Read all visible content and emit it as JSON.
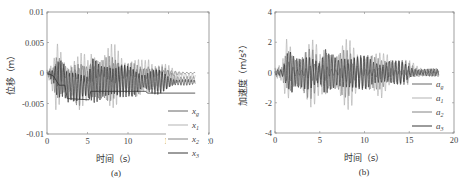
{
  "chart_data": [
    {
      "id": "a",
      "type": "line",
      "caption": "(a)",
      "title": "",
      "xlabel": "时间（s）",
      "ylabel": "位移（m）",
      "xlim": [
        0,
        20
      ],
      "ylim": [
        -0.01,
        0.01
      ],
      "xticks": [
        0,
        5,
        10,
        15,
        20
      ],
      "xtick_labels": [
        "0",
        "5",
        "10",
        "15",
        "20"
      ],
      "yticks": [
        0.01,
        0.005,
        0,
        -0.005,
        -0.01
      ],
      "ytick_labels": [
        "0.01",
        "0.005",
        "0",
        "-0.005",
        "-0.01"
      ],
      "grid": false,
      "legend_position": "lower right",
      "series": [
        {
          "name": "x_g",
          "label_base": "x",
          "label_sub": "g",
          "color": "#555555",
          "description": "ground displacement, small oscillation near 0 with drift"
        },
        {
          "name": "x_1",
          "label_base": "x",
          "label_sub": "1",
          "color": "#aaaaaa",
          "description": "floor 1 displacement"
        },
        {
          "name": "x_2",
          "label_base": "x",
          "label_sub": "2",
          "color": "#777777",
          "description": "floor 2 displacement"
        },
        {
          "name": "x_3",
          "label_base": "x",
          "label_sub": "3",
          "color": "#222222",
          "description": "floor 3 displacement"
        }
      ],
      "envelope": {
        "t": [
          0,
          0.8,
          1.2,
          1.6,
          2.0,
          2.5,
          3.0,
          4.0,
          4.5,
          5.0,
          5.6,
          6.0,
          6.5,
          7.0,
          8.0,
          8.5,
          9.0,
          9.5,
          10.0,
          11.0,
          12.0,
          12.5,
          13.0,
          14.0,
          15.0,
          16.0,
          17.0,
          18.3
        ],
        "max": [
          0.0005,
          0.002,
          0.0075,
          0.008,
          0.005,
          0.003,
          0.003,
          0.004,
          0.005,
          0.004,
          0.008,
          0.006,
          0.004,
          0.004,
          0.006,
          0.0068,
          0.0065,
          0.005,
          0.004,
          0.003,
          0.003,
          0.0045,
          0.004,
          0.003,
          0.002,
          0.001,
          0.0008,
          0.0005
        ],
        "min": [
          0.0,
          -0.004,
          -0.0095,
          -0.008,
          -0.006,
          -0.005,
          -0.004,
          -0.006,
          -0.0055,
          -0.0055,
          -0.0078,
          -0.006,
          -0.005,
          -0.004,
          -0.006,
          -0.0068,
          -0.0065,
          -0.005,
          -0.004,
          -0.004,
          -0.003,
          -0.0045,
          -0.004,
          -0.003,
          -0.002,
          -0.0015,
          -0.001,
          -0.0005
        ]
      },
      "drift_line": {
        "t": [
          0,
          0.8,
          1.5,
          2.2,
          2.5,
          5.2,
          5.4,
          6.5,
          12.2,
          12.4,
          18.3
        ],
        "y": [
          0,
          -0.0005,
          -0.002,
          -0.002,
          -0.0042,
          -0.0044,
          -0.003,
          -0.003,
          -0.003,
          -0.0033,
          -0.0033
        ]
      }
    },
    {
      "id": "b",
      "type": "line",
      "caption": "(b)",
      "title": "",
      "xlabel": "时间（s）",
      "ylabel": "加速度（m/s²）",
      "xlim": [
        0,
        20
      ],
      "ylim": [
        -4,
        4
      ],
      "xticks": [
        0,
        5,
        10,
        15,
        20
      ],
      "xtick_labels": [
        "0",
        "5",
        "10",
        "15",
        "20"
      ],
      "yticks": [
        4,
        2,
        0,
        -2,
        -4
      ],
      "ytick_labels": [
        "4",
        "2",
        "0",
        "-2",
        "-4"
      ],
      "grid": false,
      "legend_position": "lower right",
      "series": [
        {
          "name": "a_g",
          "label_base": "a",
          "label_sub": "g",
          "color": "#555555",
          "description": "ground acceleration"
        },
        {
          "name": "a_1",
          "label_base": "a",
          "label_sub": "1",
          "color": "#aaaaaa",
          "description": "floor 1 acceleration"
        },
        {
          "name": "a_2",
          "label_base": "a",
          "label_sub": "2",
          "color": "#777777",
          "description": "floor 2 acceleration"
        },
        {
          "name": "a_3",
          "label_base": "a",
          "label_sub": "3",
          "color": "#222222",
          "description": "floor 3 acceleration"
        }
      ],
      "envelope": {
        "t": [
          0,
          0.8,
          1.0,
          1.4,
          1.8,
          2.2,
          3.0,
          4.0,
          4.5,
          5.0,
          5.6,
          6.0,
          7.0,
          8.0,
          8.5,
          9.0,
          10.0,
          11.0,
          12.0,
          12.5,
          13.5,
          15.0,
          16.0,
          17.0,
          18.3
        ],
        "max": [
          0.3,
          0.6,
          1.6,
          3.5,
          2.8,
          1.5,
          1.2,
          2.1,
          2.3,
          1.6,
          3.0,
          2.0,
          1.2,
          2.3,
          2.5,
          2.3,
          1.6,
          1.2,
          1.4,
          1.8,
          1.2,
          0.8,
          0.5,
          0.4,
          0.3
        ],
        "min": [
          -0.3,
          -0.6,
          -1.5,
          -2.5,
          -2.9,
          -1.5,
          -1.4,
          -2.3,
          -2.2,
          -1.8,
          -3.0,
          -1.8,
          -1.2,
          -2.5,
          -2.9,
          -2.3,
          -1.6,
          -1.2,
          -1.9,
          -1.5,
          -1.2,
          -0.8,
          -0.5,
          -0.4,
          -0.3
        ]
      }
    }
  ]
}
